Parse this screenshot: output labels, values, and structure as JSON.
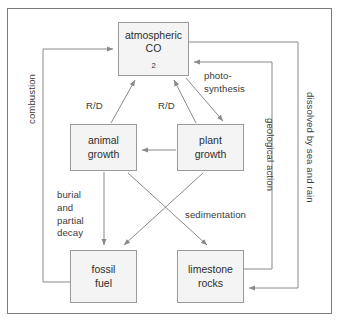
{
  "diagram": {
    "frame_color": "#7b7b7b",
    "box_fill": "#f4f4f4",
    "box_border": "#9a9a9a",
    "arrow_color": "#8a8a8a",
    "text_color": "#2e2e2e"
  },
  "nodes": [
    {
      "id": "atmospheric",
      "label_line1": "atmospheric",
      "label_line2": "CO",
      "subscript": "2"
    },
    {
      "id": "animal",
      "label_line1": "animal",
      "label_line2": "growth"
    },
    {
      "id": "plant",
      "label_line1": "plant",
      "label_line2": "growth"
    },
    {
      "id": "fossil",
      "label_line1": "fossil",
      "label_line2": "fuel"
    },
    {
      "id": "limestone",
      "label_line1": "limestone",
      "label_line2": "rocks"
    }
  ],
  "edge_labels": {
    "rd_left": "R/D",
    "rd_right": "R/D",
    "photosynthesis": "photo-\nsynthesis",
    "burial": "burial\nand\npartial\ndecay",
    "sedimentation": "sedimentation",
    "combustion": "combustion",
    "geological_action": "geological action",
    "dissolved": "dissolved by sea and rain"
  },
  "edges": [
    {
      "from": "animal",
      "to": "atmospheric",
      "label": "R/D"
    },
    {
      "from": "plant",
      "to": "atmospheric",
      "label": "R/D"
    },
    {
      "from": "atmospheric",
      "to": "plant",
      "label": "photo-synthesis"
    },
    {
      "from": "plant",
      "to": "animal",
      "label": ""
    },
    {
      "from": "animal",
      "to": "fossil",
      "label": "burial and partial decay"
    },
    {
      "from": "plant",
      "to": "fossil",
      "label": ""
    },
    {
      "from": "animal",
      "to": "limestone",
      "label": "sedimentation"
    },
    {
      "from": "fossil",
      "to": "atmospheric",
      "label": "combustion"
    },
    {
      "from": "limestone",
      "to": "atmospheric",
      "label": "geological action"
    },
    {
      "from": "atmospheric",
      "to": "limestone",
      "label": "dissolved by sea and rain"
    }
  ]
}
